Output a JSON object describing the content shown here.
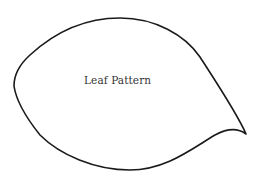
{
  "diagram": {
    "title": "Leaf Pattern",
    "shape": "leaf-outline",
    "stroke_color": "#1a1a1a",
    "background": "#ffffff"
  }
}
